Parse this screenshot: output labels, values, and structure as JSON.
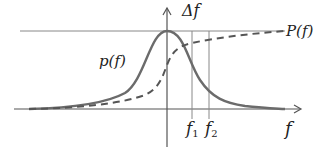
{
  "diagram": {
    "labels": {
      "delta_f": "Δf",
      "big_p": "P(f)",
      "small_p": "p(f)",
      "f1_base": "f",
      "f1_sub": "1",
      "f2_base": "f",
      "f2_sub": "2",
      "x_axis": "f"
    },
    "colors": {
      "curve": "#6b6b6b",
      "axis": "#555555",
      "guide": "#888888",
      "text": "#222222"
    },
    "curves": [
      {
        "name": "p(f)",
        "style": "solid",
        "description": "bell-shaped density peaking at f=0"
      },
      {
        "name": "P(f)",
        "style": "dashed",
        "description": "cumulative S-curve rising to top line"
      }
    ],
    "markers": [
      {
        "name": "f1",
        "x": 192
      },
      {
        "name": "f2",
        "x": 209
      }
    ]
  }
}
